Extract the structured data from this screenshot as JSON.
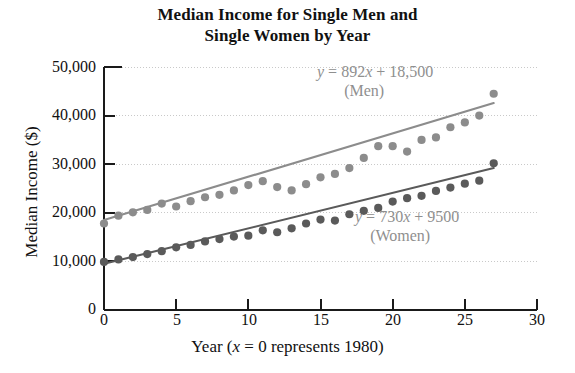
{
  "chart_data": {
    "type": "scatter",
    "title": "Median Income for Single Men and Single Women by Year",
    "title_lines": [
      "Median Income for Single Men and",
      "Single Women by Year"
    ],
    "xlabel": "Year (x = 0 represents 1980)",
    "ylabel": "Median Income ($)",
    "xlim": [
      0,
      30
    ],
    "ylim": [
      0,
      50000
    ],
    "grid": true,
    "grid_orientation": "horizontal",
    "legend_position": "inline-annotation",
    "x_ticks": [
      0,
      5,
      10,
      15,
      20,
      25,
      30
    ],
    "x_tick_labels": [
      "0",
      "5",
      "10",
      "15",
      "20",
      "25",
      "30"
    ],
    "y_ticks": [
      0,
      10000,
      20000,
      30000,
      40000,
      50000
    ],
    "y_tick_labels": [
      "0",
      "10,000",
      "20,000",
      "30,000",
      "40,000",
      "50,000"
    ],
    "series": [
      {
        "name": "Men",
        "color": "#8c8c8c",
        "marker": "circle",
        "equation": "y = 892x + 18,500",
        "slope": 892,
        "intercept": 18500,
        "x": [
          0,
          1,
          2,
          3,
          4,
          5,
          6,
          7,
          8,
          9,
          10,
          11,
          12,
          13,
          14,
          15,
          16,
          17,
          18,
          19,
          20,
          21,
          22,
          23,
          24,
          25,
          26,
          27
        ],
        "values": [
          17800,
          19400,
          20100,
          20600,
          21900,
          21300,
          22400,
          23200,
          23700,
          24600,
          25700,
          26500,
          25300,
          24600,
          25900,
          27300,
          28000,
          29200,
          31300,
          33700,
          33700,
          32600,
          35000,
          35500,
          37600,
          38600,
          40000,
          44500
        ]
      },
      {
        "name": "Women",
        "color": "#5a5a5a",
        "marker": "circle",
        "equation": "y = 730x + 9500",
        "slope": 730,
        "intercept": 9500,
        "x": [
          0,
          1,
          2,
          3,
          4,
          5,
          6,
          7,
          8,
          9,
          10,
          11,
          12,
          13,
          14,
          15,
          16,
          17,
          18,
          19,
          20,
          21,
          22,
          23,
          24,
          25,
          26,
          27
        ],
        "values": [
          9900,
          10400,
          10900,
          11500,
          12100,
          12900,
          13400,
          14100,
          14600,
          15100,
          15300,
          16400,
          16000,
          16800,
          17800,
          18600,
          18400,
          19700,
          20400,
          21000,
          22300,
          23000,
          23500,
          24500,
          25200,
          26000,
          26600,
          30200
        ]
      }
    ],
    "trendlines": [
      {
        "name": "Men",
        "color": "#8c8c8c",
        "x_start": 0,
        "y_start": 18500,
        "x_end": 27,
        "y_end": 42584
      },
      {
        "name": "Women",
        "color": "#5a5a5a",
        "x_start": 0,
        "y_start": 9500,
        "x_end": 27,
        "y_end": 29210
      }
    ],
    "annotations": [
      {
        "id": "men",
        "equation": "y = 892x + 18,500",
        "eq_prefix": "y",
        "eq_rest": " = 892",
        "eq_var": "x",
        "eq_tail": " + 18,500",
        "label": "(Men)"
      },
      {
        "id": "women",
        "equation": "y = 730x + 9500",
        "eq_prefix": "y",
        "eq_rest": " = 730",
        "eq_var": "x",
        "eq_tail": " + 9500",
        "label": "(Women)"
      }
    ],
    "xlabel_parts": {
      "before": "Year (",
      "var": "x",
      "after": " = 0 represents 1980)"
    }
  },
  "colors": {
    "men": "#8c8c8c",
    "women": "#5a5a5a",
    "axis": "#1a1a1a",
    "grid": "#c9c9c9",
    "annotation_text": "#8f8f8f"
  }
}
